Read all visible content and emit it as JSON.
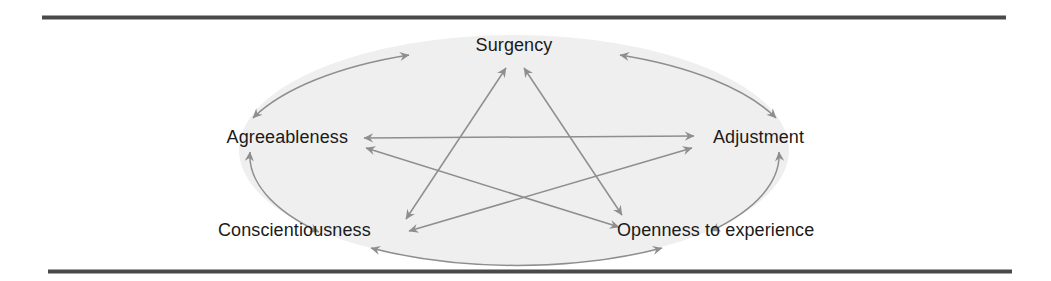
{
  "figure": {
    "kind": "circumplex-diagram",
    "background_color": "#ffffff",
    "ellipse_fill": "#efefef",
    "link_color": "#8e8e8e",
    "rule_color": "#4a4a4a",
    "label_color": "#1a1a1a"
  },
  "rules": {
    "top_label": "top horizontal rule",
    "bottom_label": "bottom horizontal rule"
  },
  "nodes": [
    {
      "id": "surgency",
      "label": "Surgency"
    },
    {
      "id": "adjustment",
      "label": "Adjustment"
    },
    {
      "id": "openness",
      "label": "Openness to experience"
    },
    {
      "id": "conscientiousness",
      "label": "Conscientiousness"
    },
    {
      "id": "agreeableness",
      "label": "Agreeableness"
    }
  ],
  "perimeter_links": [
    {
      "id": "arc-agreeableness-surgency",
      "from": "Agreeableness",
      "to": "Surgency",
      "style": "double-arrow-arc"
    },
    {
      "id": "arc-surgency-adjustment",
      "from": "Surgency",
      "to": "Adjustment",
      "style": "double-arrow-arc"
    },
    {
      "id": "arc-adjustment-openness",
      "from": "Adjustment",
      "to": "Openness to experience",
      "style": "double-arrow-arc"
    },
    {
      "id": "arc-openness-conscientiousness",
      "from": "Openness to experience",
      "to": "Conscientiousness",
      "style": "double-arrow-arc"
    },
    {
      "id": "arc-conscientiousness-agreeableness",
      "from": "Conscientiousness",
      "to": "Agreeableness",
      "style": "double-arrow-arc"
    }
  ],
  "chord_links": [
    {
      "id": "chord-agreeableness-adjustment",
      "from": "Agreeableness",
      "to": "Adjustment",
      "style": "double-arrow-line"
    },
    {
      "id": "chord-conscientiousness-surgency",
      "from": "Conscientiousness",
      "to": "Surgency",
      "style": "double-arrow-line"
    },
    {
      "id": "chord-surgency-openness",
      "from": "Surgency",
      "to": "Openness to experience",
      "style": "double-arrow-line"
    },
    {
      "id": "chord-openness-agreeableness",
      "from": "Openness to experience",
      "to": "Agreeableness",
      "style": "double-arrow-line"
    },
    {
      "id": "chord-adjustment-conscientiousness",
      "from": "Adjustment",
      "to": "Conscientiousness",
      "style": "double-arrow-line"
    }
  ]
}
